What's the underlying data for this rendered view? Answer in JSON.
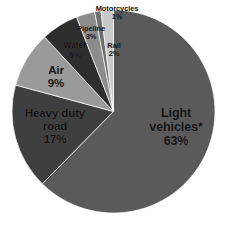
{
  "chart_data": {
    "type": "pie",
    "title": "",
    "subtitle": "",
    "xlabel": "",
    "ylabel": "",
    "legend_position": "none",
    "grid": false,
    "value_unit": "%",
    "start_angle_deg": 0,
    "direction": "clockwise",
    "categories": [
      "Light vehicles*",
      "Heavy duty road",
      "Air",
      "Water",
      "Pipeline",
      "Motorcycles",
      "Rail"
    ],
    "values": [
      63,
      17,
      9,
      6,
      3,
      1,
      2
    ],
    "labels": [
      "Light vehicles*",
      "Heavy duty road",
      "Air",
      "Water",
      "Pipeline",
      "Motorcycles",
      "Rail"
    ],
    "value_labels": [
      "63%",
      "17%",
      "9%",
      "6%",
      "3%",
      "1%",
      "2%"
    ],
    "colors": [
      "#5a5a5a",
      "#3f3f3f",
      "#9a9a9a",
      "#2e2e2e",
      "#8c8c8c",
      "#6e6e6e",
      "#c9c9c9"
    ],
    "slices": [
      {
        "name": "Light vehicles*",
        "value": 63,
        "value_label": "63%",
        "color": "#5a5a5a"
      },
      {
        "name": "Heavy duty road",
        "value": 17,
        "value_label": "17%",
        "color": "#3f3f3f"
      },
      {
        "name": "Air",
        "value": 9,
        "value_label": "9%",
        "color": "#9a9a9a"
      },
      {
        "name": "Water",
        "value": 6,
        "value_label": "6%",
        "color": "#2e2e2e"
      },
      {
        "name": "Pipeline",
        "value": 3,
        "value_label": "3%",
        "color": "#8c8c8c"
      },
      {
        "name": "Motorcycles",
        "value": 1,
        "value_label": "1%",
        "color": "#6e6e6e"
      },
      {
        "name": "Rail",
        "value": 2,
        "value_label": "2%",
        "color": "#c9c9c9"
      }
    ]
  },
  "labels": {
    "light_vehicles": {
      "name": "Light vehicles*",
      "pct": "63%"
    },
    "heavy_duty_road": {
      "name_line1": "Heavy duty",
      "name_line2": "road",
      "pct": "17%"
    },
    "air": {
      "name": "Air",
      "pct": "9%"
    },
    "water": {
      "name": "Water",
      "pct": "6%"
    },
    "pipeline": {
      "name": "Pipeline",
      "pct": "3%"
    },
    "motorcycles": {
      "name": "Motorcycles",
      "pct": "1%"
    },
    "rail": {
      "name": "Rail",
      "pct": "2%"
    }
  },
  "light_vehicles_name_lines": {
    "line1": "Light",
    "line2": "vehicles*"
  }
}
